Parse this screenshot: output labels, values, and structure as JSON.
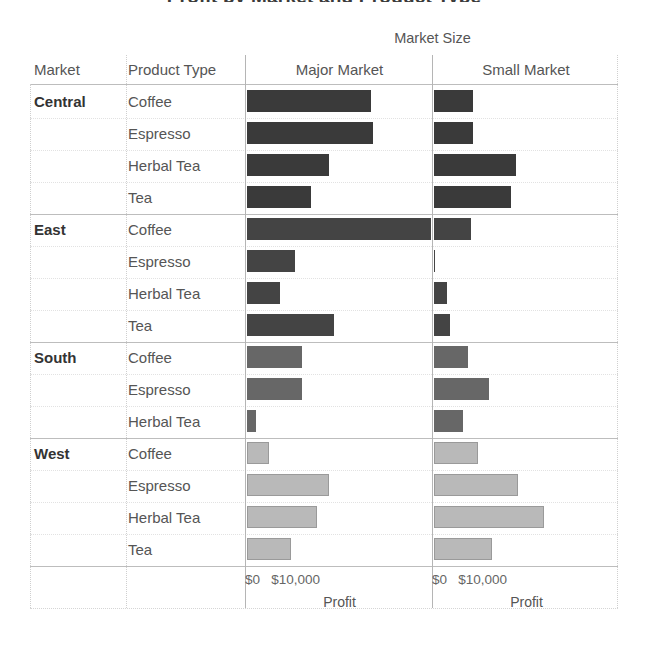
{
  "title": "Profit by Market and Product Type",
  "super_header": "Market Size",
  "columns": {
    "market": "Market",
    "product_type": "Product Type",
    "major_market": "Major Market",
    "small_market": "Small Market"
  },
  "axis": {
    "tick_zero": "$0",
    "tick_ten": "$10,000",
    "title": "Profit"
  },
  "colors": {
    "central": "#3a3a3a",
    "east": "#444444",
    "south": "#676767",
    "west": "#b9b9b9",
    "bar_border": "#9a9a9a",
    "grid": "#c9c9c9",
    "text": "#555555",
    "header_text": "#333333"
  },
  "chart_data": {
    "type": "bar",
    "title": "Profit by Market and Product Type",
    "xlabel": "Profit",
    "ylabel": "",
    "xlim": [
      0,
      45000
    ],
    "grid": true,
    "legend": "none",
    "panel_field": "Market Size",
    "panels": [
      "Major Market",
      "Small Market"
    ],
    "row_fields": [
      "Market",
      "Product Type"
    ],
    "axis_ticks": [
      {
        "label": "$0",
        "value": 0
      },
      {
        "label": "$10,000",
        "value": 10000
      }
    ],
    "rows": [
      {
        "market": "Central",
        "product": "Coffee",
        "major": 30000,
        "small": 9500
      },
      {
        "market": "Central",
        "product": "Espresso",
        "major": 30500,
        "small": 9500
      },
      {
        "market": "Central",
        "product": "Herbal Tea",
        "major": 20000,
        "small": 20000
      },
      {
        "market": "Central",
        "product": "Tea",
        "major": 15500,
        "small": 18800
      },
      {
        "market": "East",
        "product": "Coffee",
        "major": 44600,
        "small": 9000
      },
      {
        "market": "East",
        "product": "Espresso",
        "major": 11700,
        "small": 200
      },
      {
        "market": "East",
        "product": "Herbal Tea",
        "major": 8000,
        "small": 3200
      },
      {
        "market": "East",
        "product": "Tea",
        "major": 21000,
        "small": 3900
      },
      {
        "market": "South",
        "product": "Coffee",
        "major": 13400,
        "small": 8300
      },
      {
        "market": "South",
        "product": "Espresso",
        "major": 13400,
        "small": 13400
      },
      {
        "market": "South",
        "product": "Herbal Tea",
        "major": 2200,
        "small": 7100
      },
      {
        "market": "West",
        "product": "Coffee",
        "major": 4900,
        "small": 10200
      },
      {
        "market": "West",
        "product": "Espresso",
        "major": 19500,
        "small": 20000
      },
      {
        "market": "West",
        "product": "Herbal Tea",
        "major": 16600,
        "small": 26100
      },
      {
        "market": "West",
        "product": "Tea",
        "major": 10200,
        "small": 13600
      }
    ]
  },
  "layout": {
    "origin_x_major": 247,
    "origin_x_small": 434,
    "px_per_10000": 41.2,
    "row_top": 86,
    "row_height": 32,
    "panel_width": 185
  }
}
